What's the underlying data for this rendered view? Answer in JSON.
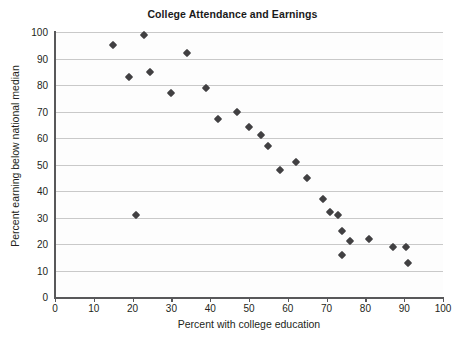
{
  "chart_data": {
    "type": "scatter",
    "title": "College Attendance and Earnings",
    "xlabel": "Percent with college education",
    "ylabel": "Percent earning below national median",
    "xlim": [
      0,
      100
    ],
    "ylim": [
      0,
      100
    ],
    "xticks": [
      0,
      10,
      20,
      30,
      40,
      50,
      60,
      70,
      80,
      90,
      100
    ],
    "yticks": [
      0,
      10,
      20,
      30,
      40,
      50,
      60,
      70,
      80,
      90,
      100
    ],
    "grid": "horizontal",
    "legend": null,
    "marker": "diamond",
    "marker_color": "#414042",
    "points": [
      {
        "x": 15,
        "y": 95
      },
      {
        "x": 19,
        "y": 83
      },
      {
        "x": 21,
        "y": 31
      },
      {
        "x": 23,
        "y": 99
      },
      {
        "x": 24.5,
        "y": 85
      },
      {
        "x": 30,
        "y": 77
      },
      {
        "x": 34,
        "y": 92
      },
      {
        "x": 39,
        "y": 79
      },
      {
        "x": 42,
        "y": 67
      },
      {
        "x": 47,
        "y": 70
      },
      {
        "x": 50,
        "y": 64
      },
      {
        "x": 53,
        "y": 61
      },
      {
        "x": 55,
        "y": 57
      },
      {
        "x": 58,
        "y": 48
      },
      {
        "x": 62,
        "y": 51
      },
      {
        "x": 65,
        "y": 45
      },
      {
        "x": 69,
        "y": 37
      },
      {
        "x": 71,
        "y": 32
      },
      {
        "x": 73,
        "y": 31
      },
      {
        "x": 74,
        "y": 25
      },
      {
        "x": 74,
        "y": 16
      },
      {
        "x": 76,
        "y": 21
      },
      {
        "x": 81,
        "y": 22
      },
      {
        "x": 87,
        "y": 19
      },
      {
        "x": 90.5,
        "y": 19
      },
      {
        "x": 91,
        "y": 13
      }
    ]
  },
  "colors": {
    "marker": "#414042",
    "axis": "#58585a",
    "gridline": "#c9c9c9",
    "text": "#231f20",
    "background": "#ffffff"
  }
}
